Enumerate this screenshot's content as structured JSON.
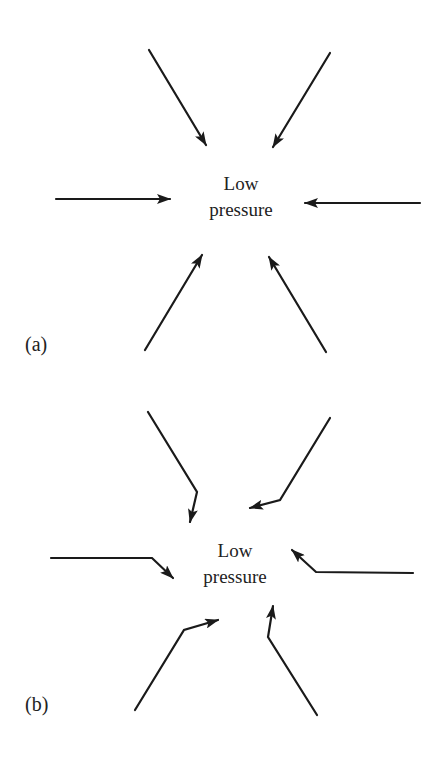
{
  "figure": {
    "panels": [
      {
        "id": "a",
        "label": "(a)",
        "center_label_line1": "Low",
        "center_label_line2": "pressure",
        "description": "Air flows directly toward low pressure (no Coriolis deflection)",
        "arrows": [
          {
            "name": "top-left",
            "points": "149,50 206,145"
          },
          {
            "name": "top-right",
            "points": "330,53 273,147"
          },
          {
            "name": "left",
            "points": "56,199 170,199"
          },
          {
            "name": "right",
            "points": "420,203 305,203"
          },
          {
            "name": "bottom-left",
            "points": "145,350 202,255"
          },
          {
            "name": "bottom-right",
            "points": "326,352 269,257"
          }
        ]
      },
      {
        "id": "b",
        "label": "(b)",
        "center_label_line1": "Low",
        "center_label_line2": "pressure",
        "description": "Air flow toward low pressure deflected (Coriolis effect)",
        "arrows": [
          {
            "name": "top-left",
            "points": "148,412 197,492 190,522"
          },
          {
            "name": "top-right",
            "points": "330,418 280,500 250,508"
          },
          {
            "name": "left",
            "points": "51,558 152,558 173,578"
          },
          {
            "name": "right",
            "points": "413,573 316,572 292,550"
          },
          {
            "name": "bottom-left",
            "points": "135,710 184,630 218,620"
          },
          {
            "name": "bottom-right",
            "points": "317,715 268,637 273,606"
          }
        ]
      }
    ],
    "colors": {
      "background": "#ffffff",
      "ink": "#1a1a1a",
      "text": "#222222"
    }
  }
}
